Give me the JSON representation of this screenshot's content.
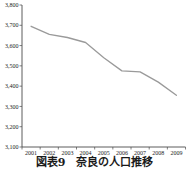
{
  "caption": {
    "text": "図表9　奈良の人口推移"
  },
  "chart_data": {
    "type": "line",
    "title": "図表9　奈良の人口推移",
    "categories": [
      "2001",
      "2002",
      "2003",
      "2004",
      "2005",
      "2006",
      "2007",
      "2008",
      "2009"
    ],
    "values": [
      3695,
      3655,
      3640,
      3615,
      3540,
      3475,
      3470,
      3420,
      3355
    ],
    "xlabel": "",
    "ylabel": "",
    "ylim": [
      3100,
      3800
    ],
    "ytick_step": 100,
    "ytick_labels": [
      "3,100",
      "3,200",
      "3,300",
      "3,400",
      "3,500",
      "3,600",
      "3,700",
      "3,800"
    ],
    "grid": false,
    "legend_position": "none",
    "line_color": "#9a9a9a",
    "axis_color": "#4a4a4a",
    "text_color": "#1c1c1c"
  }
}
